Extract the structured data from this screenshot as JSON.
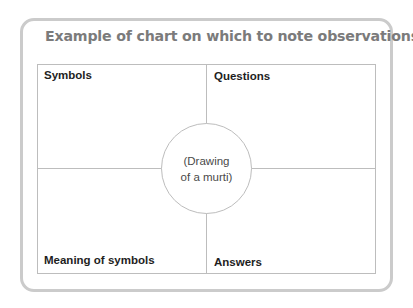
{
  "title": "Example of chart on which to note observations",
  "quadrants": {
    "top_left": "Symbols",
    "top_right": "Questions",
    "bottom_left": "Meaning of symbols",
    "bottom_right": "Answers"
  },
  "center": {
    "line1": "(Drawing",
    "line2": "of a murti)"
  },
  "colors": {
    "frame_border": "#cbcbcb",
    "title": "#7b7b7b",
    "grid_lines": "#bdbdbd",
    "label_text": "#1e1e1e"
  }
}
